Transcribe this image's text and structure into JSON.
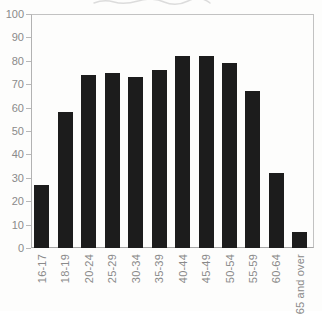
{
  "chart_data": {
    "type": "bar",
    "title": "",
    "subtitle": "",
    "xlabel": "",
    "ylabel": "",
    "categories": [
      "16-17",
      "18-19",
      "20-24",
      "25-29",
      "30-34",
      "35-39",
      "40-44",
      "45-49",
      "50-54",
      "55-59",
      "60-64",
      "65 and over"
    ],
    "values": [
      27,
      58,
      74,
      75,
      73,
      76,
      82,
      82,
      79,
      67,
      32,
      7
    ],
    "ylim": [
      0,
      100
    ],
    "y_ticks": [
      0,
      10,
      20,
      30,
      40,
      50,
      60,
      70,
      80,
      90,
      100
    ],
    "grid": false,
    "legend": false,
    "bar_color": "#1c1c1c",
    "axis_color": "#b2b2b2",
    "border_color": "#c2c2c2",
    "tick_label_color": "#8a8a8a",
    "background_color": "#fdfdfc"
  }
}
